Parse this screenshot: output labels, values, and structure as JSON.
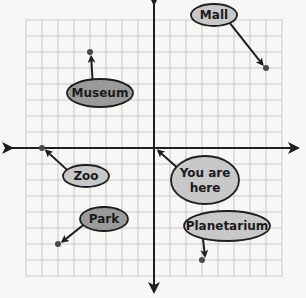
{
  "diagram": {
    "type": "coordinate-grid-map",
    "grid": {
      "x_min": -8,
      "x_max": 8,
      "y_min": -8,
      "y_max": 8,
      "cell_px": 16,
      "origin_px": [
        154,
        148
      ],
      "grid_color": "#c9c9c9",
      "axis_color": "#1e1e1e"
    },
    "colors": {
      "background": "#f7f7f5",
      "label_fill_light": "#c8c8c8",
      "label_fill_dark": "#9a9a9a",
      "label_stroke": "#1e1e1e",
      "point_color": "#4a4a4a"
    },
    "locations": [
      {
        "name": "Mall",
        "x": 7,
        "y": 5,
        "label_cx": 214,
        "label_cy": 15,
        "label_rx": 23,
        "label_ry": 11,
        "fill": "#c8c8c8",
        "lines": [
          "Mall"
        ]
      },
      {
        "name": "Museum",
        "x": -4,
        "y": 6,
        "label_cx": 100,
        "label_cy": 93,
        "label_rx": 33,
        "label_ry": 14,
        "fill": "#9a9a9a",
        "lines": [
          "Museum"
        ]
      },
      {
        "name": "Zoo",
        "x": -7,
        "y": 0,
        "label_cx": 86,
        "label_cy": 176,
        "label_rx": 23,
        "label_ry": 11,
        "fill": "#c8c8c8",
        "lines": [
          "Zoo"
        ]
      },
      {
        "name": "You are here",
        "x": 0,
        "y": 0,
        "label_cx": 205,
        "label_cy": 180,
        "label_rx": 34,
        "label_ry": 24,
        "fill": "#c8c8c8",
        "lines": [
          "You are",
          "here"
        ]
      },
      {
        "name": "Park",
        "x": -6,
        "y": -6,
        "label_cx": 104,
        "label_cy": 219,
        "label_rx": 24,
        "label_ry": 12,
        "fill": "#9a9a9a",
        "lines": [
          "Park"
        ]
      },
      {
        "name": "Planetarium",
        "x": 3,
        "y": -7,
        "label_cx": 227,
        "label_cy": 226,
        "label_rx": 43,
        "label_ry": 15,
        "fill": "#c8c8c8",
        "lines": [
          "Planetarium"
        ]
      }
    ]
  }
}
